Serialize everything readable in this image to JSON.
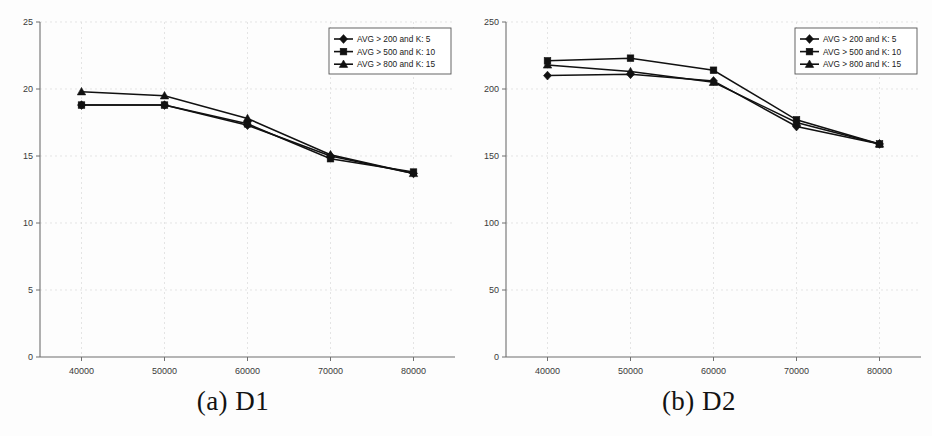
{
  "figure": {
    "background": "#fdfdfd",
    "ink_color": "#111111",
    "panels": [
      {
        "id": "D1",
        "caption": "(a) D1",
        "legend_position": "top-right"
      },
      {
        "id": "D2",
        "caption": "(b) D2",
        "legend_position": "top-right"
      }
    ]
  },
  "chart_data": [
    {
      "type": "line",
      "title": "(a) D1",
      "xlabel": "",
      "ylabel": "",
      "x": [
        40000,
        50000,
        60000,
        70000,
        80000
      ],
      "xtick_labels": [
        "40000",
        "50000",
        "60000",
        "70000",
        "80000"
      ],
      "ytick_labels": [
        "0",
        "5",
        "10",
        "15",
        "20",
        "25"
      ],
      "yticks": [
        0,
        5,
        10,
        15,
        20,
        25
      ],
      "xlim": [
        35000,
        85000
      ],
      "ylim": [
        0,
        25
      ],
      "grid": true,
      "legend": "top-right",
      "series": [
        {
          "name": "AVG > 200 and K: 5",
          "marker": "diamond",
          "values": [
            18.8,
            18.8,
            17.3,
            15.0,
            13.7
          ]
        },
        {
          "name": "AVG > 500 and K: 10",
          "marker": "square",
          "values": [
            18.8,
            18.8,
            17.4,
            14.8,
            13.8
          ]
        },
        {
          "name": "AVG > 800 and K: 15",
          "marker": "triangle",
          "values": [
            19.8,
            19.5,
            17.8,
            15.1,
            13.7
          ]
        }
      ]
    },
    {
      "type": "line",
      "title": "(b) D2",
      "xlabel": "",
      "ylabel": "",
      "x": [
        40000,
        50000,
        60000,
        70000,
        80000
      ],
      "xtick_labels": [
        "40000",
        "50000",
        "60000",
        "70000",
        "80000"
      ],
      "ytick_labels": [
        "0",
        "50",
        "100",
        "150",
        "200",
        "250"
      ],
      "yticks": [
        0,
        50,
        100,
        150,
        200,
        250
      ],
      "xlim": [
        35000,
        85000
      ],
      "ylim": [
        0,
        250
      ],
      "grid": true,
      "legend": "top-right",
      "series": [
        {
          "name": "AVG > 200 and K: 5",
          "marker": "diamond",
          "values": [
            210,
            211,
            206,
            172,
            159
          ]
        },
        {
          "name": "AVG > 500 and K: 10",
          "marker": "square",
          "values": [
            221,
            223,
            214,
            177,
            159
          ]
        },
        {
          "name": "AVG > 800 and K: 15",
          "marker": "triangle",
          "values": [
            218,
            213,
            205,
            175,
            159
          ]
        }
      ]
    }
  ],
  "legend": {
    "entries": [
      {
        "label": "AVG > 200 and K: 5",
        "marker": "diamond"
      },
      {
        "label": "AVG > 500 and K: 10",
        "marker": "square"
      },
      {
        "label": "AVG > 800 and K: 15",
        "marker": "triangle"
      }
    ]
  }
}
